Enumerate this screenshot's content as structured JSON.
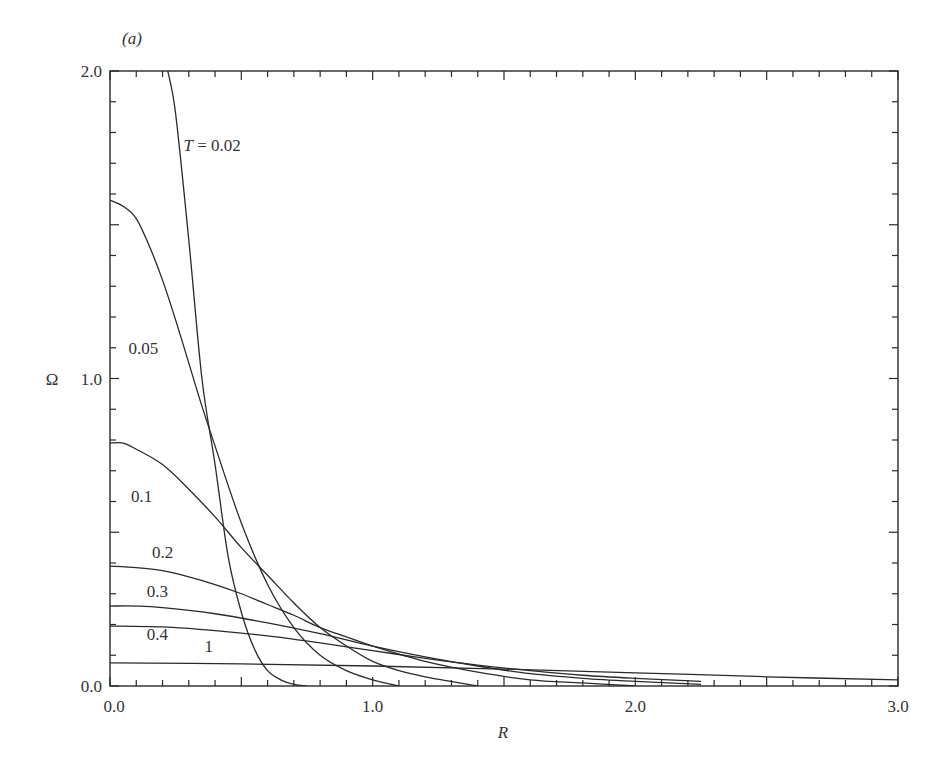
{
  "panel_label": "(a)",
  "chart_data": {
    "type": "line",
    "title": "",
    "xlabel": "R",
    "ylabel": "Ω",
    "xlim": [
      0.0,
      3.0
    ],
    "ylim": [
      0.0,
      2.0
    ],
    "x_ticks": [
      {
        "v": 0.0,
        "label": "0.0"
      },
      {
        "v": 1.0,
        "label": "1.0"
      },
      {
        "v": 2.0,
        "label": "2.0"
      },
      {
        "v": 3.0,
        "label": "3.0"
      }
    ],
    "y_ticks": [
      {
        "v": 0.0,
        "label": "0.0"
      },
      {
        "v": 1.0,
        "label": "1.0"
      },
      {
        "v": 2.0,
        "label": "2.0"
      }
    ],
    "x_minor_step": 0.1,
    "y_minor_step": 0.1,
    "grid": false,
    "legend": "inline curve labels",
    "series": [
      {
        "name": "T = 0.02",
        "label": "T = 0.02",
        "label_pos": [
          0.28,
          1.74
        ],
        "x": [
          0.22,
          0.25,
          0.3,
          0.35,
          0.4,
          0.45,
          0.5,
          0.55,
          0.6,
          0.65,
          0.7,
          0.75
        ],
        "values": [
          2.0,
          1.86,
          1.45,
          1.0,
          0.72,
          0.42,
          0.24,
          0.12,
          0.05,
          0.02,
          0.005,
          0.0
        ]
      },
      {
        "name": "T = 0.05",
        "label": "0.05",
        "label_pos": [
          0.07,
          1.08
        ],
        "x": [
          0.0,
          0.05,
          0.1,
          0.15,
          0.2,
          0.25,
          0.3,
          0.35,
          0.4,
          0.5,
          0.6,
          0.7,
          0.8,
          0.9,
          1.0,
          1.1
        ],
        "values": [
          1.58,
          1.56,
          1.52,
          1.43,
          1.32,
          1.19,
          1.05,
          0.91,
          0.78,
          0.53,
          0.33,
          0.19,
          0.1,
          0.05,
          0.02,
          0.0
        ]
      },
      {
        "name": "T = 0.1",
        "label": "0.1",
        "label_pos": [
          0.08,
          0.6
        ],
        "x": [
          0.0,
          0.05,
          0.1,
          0.2,
          0.3,
          0.4,
          0.5,
          0.6,
          0.7,
          0.8,
          0.9,
          1.0,
          1.1,
          1.2,
          1.4
        ],
        "values": [
          0.79,
          0.79,
          0.77,
          0.72,
          0.64,
          0.55,
          0.45,
          0.36,
          0.27,
          0.19,
          0.13,
          0.08,
          0.05,
          0.03,
          0.0
        ]
      },
      {
        "name": "T = 0.2",
        "label": "0.2",
        "label_pos": [
          0.16,
          0.415
        ],
        "x": [
          0.0,
          0.1,
          0.2,
          0.3,
          0.4,
          0.5,
          0.6,
          0.7,
          0.8,
          0.9,
          1.0,
          1.2,
          1.4,
          1.6,
          1.8,
          2.0
        ],
        "values": [
          0.39,
          0.385,
          0.375,
          0.355,
          0.33,
          0.3,
          0.265,
          0.23,
          0.19,
          0.16,
          0.13,
          0.08,
          0.045,
          0.02,
          0.01,
          0.0
        ]
      },
      {
        "name": "T = 0.3",
        "label": "0.3",
        "label_pos": [
          0.14,
          0.29
        ],
        "x": [
          0.0,
          0.1,
          0.2,
          0.4,
          0.6,
          0.8,
          1.0,
          1.2,
          1.4,
          1.6,
          1.8,
          2.0,
          2.25
        ],
        "values": [
          0.26,
          0.26,
          0.255,
          0.235,
          0.205,
          0.17,
          0.13,
          0.095,
          0.065,
          0.04,
          0.025,
          0.015,
          0.005
        ]
      },
      {
        "name": "T = 0.4",
        "label": "0.4",
        "label_pos": [
          0.14,
          0.15
        ],
        "x": [
          0.0,
          0.2,
          0.4,
          0.6,
          0.8,
          1.0,
          1.2,
          1.4,
          1.6,
          1.8,
          2.0,
          2.25
        ],
        "values": [
          0.195,
          0.192,
          0.18,
          0.163,
          0.14,
          0.115,
          0.09,
          0.068,
          0.05,
          0.035,
          0.025,
          0.015
        ]
      },
      {
        "name": "T = 1",
        "label": "1",
        "label_pos": [
          0.36,
          0.11
        ],
        "x": [
          0.0,
          0.5,
          1.0,
          1.5,
          2.0,
          2.5,
          3.0
        ],
        "values": [
          0.075,
          0.072,
          0.065,
          0.055,
          0.043,
          0.03,
          0.02
        ]
      }
    ]
  }
}
